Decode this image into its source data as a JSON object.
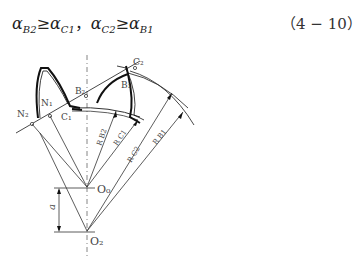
{
  "equation": {
    "text": "αB2≥αC1，αC2≥αB1",
    "parts": [
      {
        "base": "α",
        "sub": "B2"
      },
      {
        "op": "≥"
      },
      {
        "base": "α",
        "sub": "C1"
      },
      {
        "sep": "，"
      },
      {
        "base": "α",
        "sub": "C2"
      },
      {
        "op": "≥"
      },
      {
        "base": "α",
        "sub": "B1"
      }
    ],
    "number": "（4 − 10）"
  },
  "figure": {
    "labels": {
      "N1": "N₁",
      "N2": "N₂",
      "C1": "C₁",
      "C2": "C₂",
      "B1": "B₁",
      "B2": "B₂",
      "O0": "O₀",
      "O2": "O₂",
      "a": "a",
      "RB2": "R B2",
      "RC1": "R C1",
      "RC2": "R C2",
      "RB1": "R B1"
    },
    "line_color": "#333333",
    "tooth_color": "#222222"
  }
}
